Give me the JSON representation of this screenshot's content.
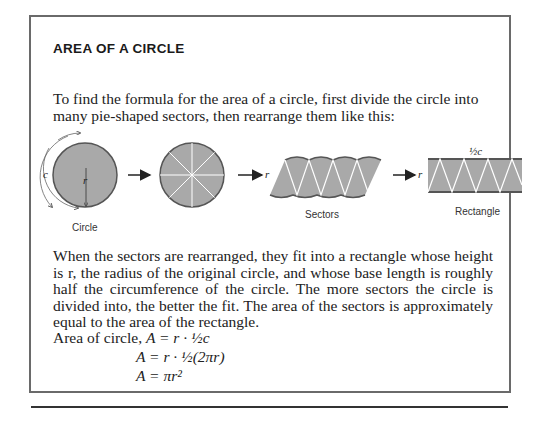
{
  "title": "AREA OF A CIRCLE",
  "intro": "To find the formula for the area of a circle, first divide the circle into many pie-shaped sectors, then rearrange them like this:",
  "diagram": {
    "labels": {
      "circle": "Circle",
      "sectors": "Sectors",
      "rectangle": "Rectangle",
      "c": "c",
      "r": "r",
      "half_c": "½c"
    },
    "colors": {
      "fill": "#a9a9a9",
      "stroke": "#555555",
      "sector_lines": "#ffffff"
    }
  },
  "paragraph": "When the sectors are rearranged, they fit into a rectangle whose height is r, the radius of the original circle, and whose base length is roughly half the circumference of the circle. The more sectors the circle is divided into, the better the fit. The area of the sectors is approximately equal to the area of the rectangle.",
  "formulas": {
    "lead": "Area of circle,",
    "line1": "A = r · ½c",
    "line2": "A = r · ½(2πr)",
    "line3": "A = πr²"
  }
}
